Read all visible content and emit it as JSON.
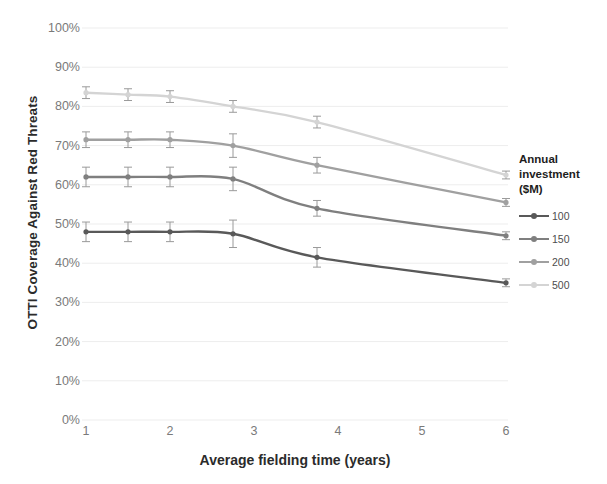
{
  "chart_data": {
    "type": "line",
    "title": "",
    "xlabel": "Average fielding time (years)",
    "ylabel": "OTTI Coverage Against Red Threats",
    "x": [
      1,
      1.5,
      2,
      2.75,
      3.75,
      6
    ],
    "xlim": [
      1,
      6
    ],
    "ylim": [
      0,
      100
    ],
    "y_tick_labels": [
      "0%",
      "10%",
      "20%",
      "30%",
      "40%",
      "50%",
      "60%",
      "70%",
      "80%",
      "90%",
      "100%"
    ],
    "y_tick_values": [
      0,
      10,
      20,
      30,
      40,
      50,
      60,
      70,
      80,
      90,
      100
    ],
    "x_tick_labels": [
      "1",
      "2",
      "3",
      "4",
      "5",
      "6"
    ],
    "x_tick_values": [
      1,
      2,
      3,
      4,
      5,
      6
    ],
    "grid": "horizontal",
    "units": "percent",
    "legend_position": "right",
    "legend_title": "Annual investment ($M)",
    "error_bars": true,
    "series": [
      {
        "name": "100",
        "color": "#595959",
        "values": [
          48,
          48,
          48,
          47.5,
          41.5,
          35
        ],
        "errors": [
          2.5,
          2.5,
          2.5,
          3.5,
          2.5,
          1.0
        ]
      },
      {
        "name": "150",
        "color": "#7f7f7f",
        "values": [
          62,
          62,
          62,
          61.5,
          54,
          47
        ],
        "errors": [
          2.5,
          2.5,
          2.5,
          3.0,
          2.0,
          1.0
        ]
      },
      {
        "name": "200",
        "color": "#a0a0a0",
        "values": [
          71.5,
          71.5,
          71.5,
          70,
          65,
          55.5
        ],
        "errors": [
          2.0,
          2.0,
          2.0,
          3.0,
          2.0,
          1.0
        ]
      },
      {
        "name": "500",
        "color": "#d4d4d4",
        "values": [
          83.5,
          83,
          82.5,
          80,
          76,
          62.5
        ],
        "errors": [
          1.5,
          1.5,
          1.5,
          1.5,
          1.5,
          1.0
        ]
      }
    ]
  },
  "axes": {
    "y_title": "OTTI Coverage Against Red Threats",
    "x_title": "Average fielding time (years)"
  },
  "legend": {
    "title_line1": "Annual",
    "title_line2": "investment",
    "title_line3": "($M)",
    "items": [
      {
        "label": "100",
        "color": "#595959"
      },
      {
        "label": "150",
        "color": "#7f7f7f"
      },
      {
        "label": "200",
        "color": "#a0a0a0"
      },
      {
        "label": "500",
        "color": "#d4d4d4"
      }
    ]
  },
  "style": {
    "gridline_color": "#ededed",
    "tick_label_color": "#7a7a7a",
    "title_color": "#2b2b2b",
    "background": "#ffffff"
  }
}
